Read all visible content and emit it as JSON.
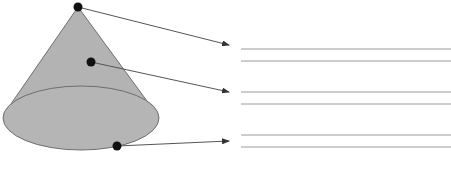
{
  "diagram": {
    "title": "",
    "shape": "cone",
    "colors": {
      "fill": "#b3b3b3",
      "stroke": "#6e6e6e",
      "dot": "#111111",
      "leader": "#555555",
      "answer_line": "#9a9a9a",
      "background": "#ffffff"
    },
    "labels": [
      {
        "id": "apex",
        "point": "vertex",
        "answer": ""
      },
      {
        "id": "lateral-surface",
        "point": "curved surface",
        "answer": ""
      },
      {
        "id": "base-edge",
        "point": "base edge",
        "answer": ""
      }
    ]
  }
}
